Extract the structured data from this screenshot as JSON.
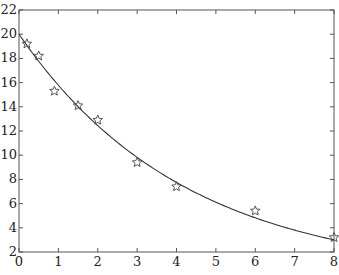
{
  "chart_data": {
    "type": "scatter",
    "title": "",
    "xlabel": "",
    "ylabel": "",
    "xlim": [
      0,
      8
    ],
    "ylim": [
      2,
      22
    ],
    "x_ticks": [
      0,
      1,
      2,
      3,
      4,
      5,
      6,
      7,
      8
    ],
    "y_ticks": [
      2,
      4,
      6,
      8,
      10,
      12,
      14,
      16,
      18,
      20,
      22
    ],
    "grid": false,
    "legend": null,
    "series": [
      {
        "name": "data",
        "marker": "star",
        "x": [
          0.2,
          0.5,
          0.9,
          1.5,
          2.0,
          3.0,
          4.0,
          6.0,
          8.0
        ],
        "y": [
          19.2,
          18.2,
          15.3,
          14.1,
          12.9,
          9.4,
          7.4,
          5.4,
          3.2
        ]
      },
      {
        "name": "fit",
        "style": "line",
        "model": "y = 20*exp(-0.237*x)",
        "a": 20,
        "k": 0.237
      }
    ],
    "colors": {
      "line": "#333333",
      "marker": "#444444",
      "axis": "#555555"
    }
  }
}
